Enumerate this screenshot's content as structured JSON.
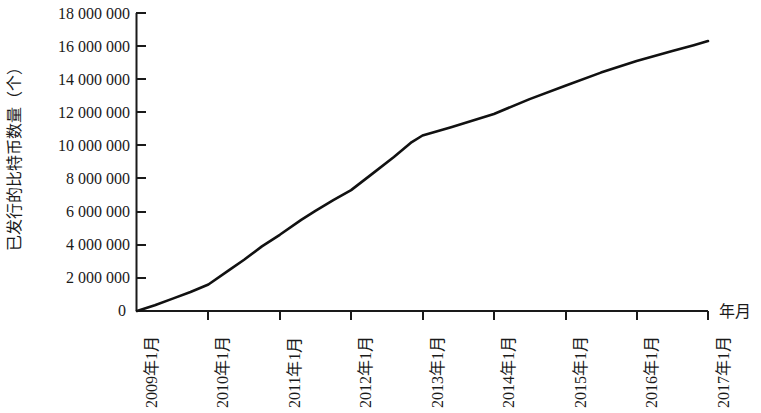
{
  "chart_data": {
    "type": "line",
    "title": "",
    "xlabel": "年月",
    "ylabel": "已发行的比特币数量（个）",
    "ylim": [
      0,
      18000000
    ],
    "grid": false,
    "legend": null,
    "line_color": "#111111",
    "background_color": "#ffffff",
    "axis_color": "#1a1a1a",
    "y_ticks": [
      "18 000 000",
      "16 000 000",
      "14 000 000",
      "12 000 000",
      "10 000 000",
      "8 000 000",
      "6 000 000",
      "4 000 000",
      "2 000 000",
      "0"
    ],
    "y_tick_values": [
      18000000,
      16000000,
      14000000,
      12000000,
      10000000,
      8000000,
      6000000,
      4000000,
      2000000,
      0
    ],
    "categories": [
      "2009年1月",
      "2010年1月",
      "2011年1月",
      "2012年1月",
      "2013年1月",
      "2014年1月",
      "2015年1月",
      "2016年1月",
      "2017年1月"
    ],
    "x": [
      2009,
      2010,
      2011,
      2012,
      2013,
      2014,
      2015,
      2016,
      2017
    ],
    "values": [
      0,
      1600000,
      4600000,
      7300000,
      10600000,
      11900000,
      13600000,
      15100000,
      16300000
    ],
    "series": [
      {
        "name": "已发行的比特币数量",
        "values": [
          0,
          1600000,
          4600000,
          7300000,
          10600000,
          11900000,
          13600000,
          15100000,
          16300000
        ]
      }
    ],
    "detailed_points": [
      {
        "x": 2009.0,
        "y": 0
      },
      {
        "x": 2009.25,
        "y": 350000
      },
      {
        "x": 2009.5,
        "y": 750000
      },
      {
        "x": 2009.75,
        "y": 1150000
      },
      {
        "x": 2010.0,
        "y": 1600000
      },
      {
        "x": 2010.3,
        "y": 2500000
      },
      {
        "x": 2010.5,
        "y": 3100000
      },
      {
        "x": 2010.75,
        "y": 3900000
      },
      {
        "x": 2011.0,
        "y": 4600000
      },
      {
        "x": 2011.3,
        "y": 5500000
      },
      {
        "x": 2011.5,
        "y": 6050000
      },
      {
        "x": 2011.75,
        "y": 6700000
      },
      {
        "x": 2012.0,
        "y": 7300000
      },
      {
        "x": 2012.3,
        "y": 8300000
      },
      {
        "x": 2012.6,
        "y": 9300000
      },
      {
        "x": 2012.85,
        "y": 10200000
      },
      {
        "x": 2013.0,
        "y": 10600000
      },
      {
        "x": 2013.4,
        "y": 11100000
      },
      {
        "x": 2014.0,
        "y": 11900000
      },
      {
        "x": 2014.5,
        "y": 12800000
      },
      {
        "x": 2015.0,
        "y": 13600000
      },
      {
        "x": 2015.5,
        "y": 14400000
      },
      {
        "x": 2016.0,
        "y": 15100000
      },
      {
        "x": 2016.5,
        "y": 15700000
      },
      {
        "x": 2016.8,
        "y": 16050000
      },
      {
        "x": 2017.0,
        "y": 16300000
      }
    ]
  },
  "axis": {
    "zero_label": "0",
    "x_title": "年月"
  }
}
